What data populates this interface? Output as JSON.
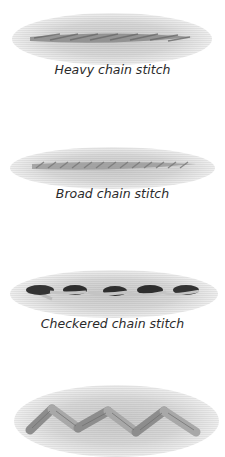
{
  "stitches": [
    {
      "label": "Heavy chain stitch"
    },
    {
      "label": "Broad chain stitch"
    },
    {
      "label": "Checkered chain stitch"
    },
    {
      "label": ""
    }
  ]
}
